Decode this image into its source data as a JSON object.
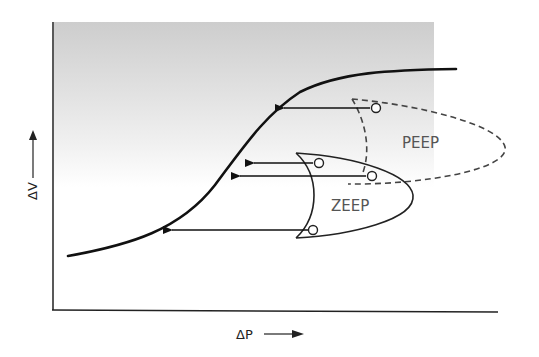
{
  "diagram": {
    "background_gradient": [
      "#cfcfcf",
      "#ffffff"
    ],
    "x_axis_label": "ΔP",
    "y_axis_label": "ΔV",
    "regions": [
      {
        "name": "ZEEP",
        "label": "ZEEP",
        "style": "solid"
      },
      {
        "name": "PEEP",
        "label": "PEEP",
        "style": "dashed"
      }
    ],
    "arrows_count": 4,
    "colors": {
      "curve": "#111111",
      "text": "#555555",
      "axis": "#222222"
    }
  }
}
